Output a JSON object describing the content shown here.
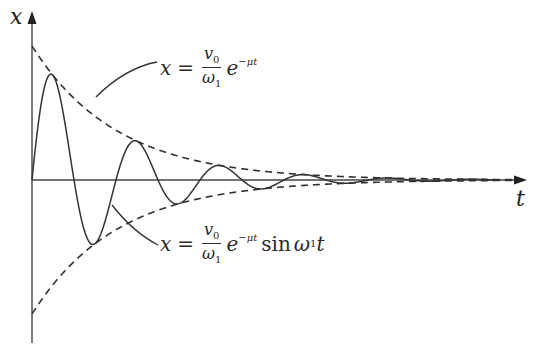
{
  "axes": {
    "y_label": "x",
    "x_label": "t"
  },
  "equations": {
    "envelope": {
      "lhs": "x",
      "equals": "=",
      "numerator": "v",
      "numerator_sub": "0",
      "denominator": "ω",
      "denominator_sub": "1",
      "exp_base": "e",
      "exponent": "−μt"
    },
    "motion": {
      "lhs": "x",
      "equals": "=",
      "numerator": "v",
      "numerator_sub": "0",
      "denominator": "ω",
      "denominator_sub": "1",
      "exp_base": "e",
      "exponent": "−μt",
      "func": "sin",
      "arg": "ω",
      "arg_sub": "1",
      "arg_var": "t"
    }
  },
  "chart_data": {
    "type": "line",
    "title": "",
    "xlabel": "t",
    "ylabel": "x",
    "grid": false,
    "series": [
      {
        "name": "x = (v0/ω1) e^(−μt)",
        "style": "dashed",
        "description": "upper decay envelope"
      },
      {
        "name": "x = −(v0/ω1) e^(−μt)",
        "style": "dashed",
        "description": "lower decay envelope"
      },
      {
        "name": "x = (v0/ω1) e^(−μt) sin ω1 t",
        "style": "solid",
        "description": "damped oscillation"
      }
    ],
    "annotations": [
      "x = v0/ω1 e^(−μt)",
      "x = v0/ω1 e^(−μt) sin ω1 t"
    ]
  }
}
